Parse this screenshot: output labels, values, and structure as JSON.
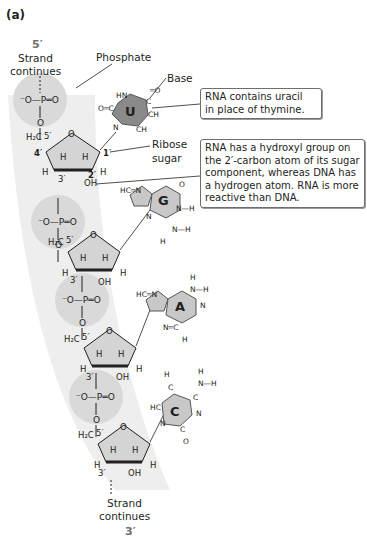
{
  "panel_label": "(a)",
  "top": {
    "end": "5′",
    "strand_label_line1": "Strand",
    "strand_label_line2": "continues"
  },
  "bottom": {
    "end": "3′",
    "strand_label_line1": "Strand",
    "strand_label_line2": "continues"
  },
  "labels": {
    "phosphate": "Phosphate",
    "base": "Base",
    "ribose_line1": "Ribose",
    "ribose_line2": "sugar"
  },
  "callouts": {
    "uracil": [
      "RNA contains uracil",
      "in place of thymine."
    ],
    "hydroxyl": [
      "RNA has a hydroxyl group on",
      "the 2′-carbon atom of its sugar",
      "component, whereas DNA has",
      "a hydrogen atom. RNA is more",
      "reactive than DNA."
    ]
  },
  "nucleotides": [
    {
      "base": "U",
      "base_name": "uracil"
    },
    {
      "base": "G",
      "base_name": "guanine"
    },
    {
      "base": "A",
      "base_name": "adenine"
    },
    {
      "base": "C",
      "base_name": "cytosine"
    }
  ],
  "atoms": {
    "phosphate_formula": "⁻O—P═O",
    "h2c": "H₂C",
    "c5": "5′",
    "c4": "4′",
    "c3": "3′",
    "c2": "2′",
    "c1": "1′",
    "oh": "OH",
    "o": "O",
    "h": "H"
  },
  "colors": {
    "strand_band": "#ececec",
    "phosphate_circle": "#d9d9d9",
    "sugar_fill": "#d4d4d4",
    "base_fill": "#c8c8c8",
    "uracil_fill": "#8a8a8a",
    "prime_text": "#6d6e70"
  }
}
